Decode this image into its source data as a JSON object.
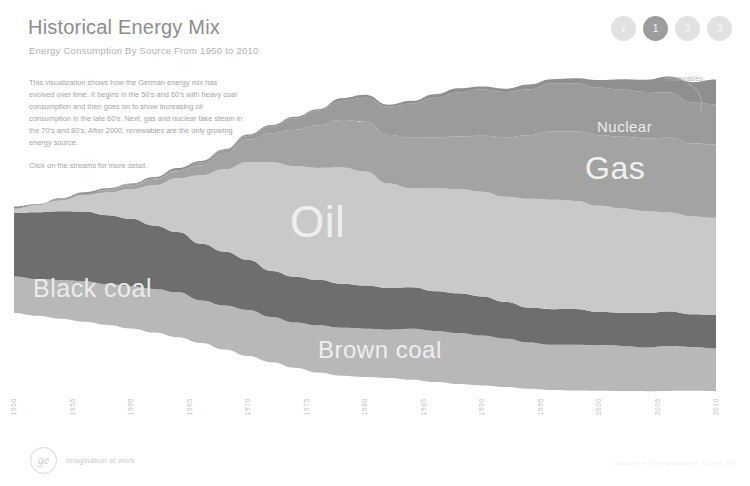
{
  "header": {
    "title": "Historical Energy Mix",
    "subtitle": "Energy Consumption By Source From 1950 to 2010"
  },
  "nav": {
    "back_label": "‹",
    "items": [
      {
        "label": "1",
        "active": true
      },
      {
        "label": "2",
        "active": false
      },
      {
        "label": "3",
        "active": false
      }
    ]
  },
  "intro": {
    "paragraph": "This visualization shows how the German energy mix has evolved over time. It begins in the 50's and 60's with heavy coal consumption and then goes on to show increasing oil consumption in the late 60's. Next, gas and nuclear take steam in the 70's and 80's. After 2000, renewables are the only growing energy source.",
    "hint": "Click on the streams for more detail."
  },
  "labels": {
    "oil": "Oil",
    "gas": "Gas",
    "nuclear": "Nuclear",
    "black_coal": "Black coal",
    "brown_coal": "Brown coal",
    "renewables": "Renewables"
  },
  "footer": {
    "logo_text": "ge",
    "tagline": "Imagination at work",
    "sources": "Sources: AG Energiebilanzen, Kohlen, EPI"
  },
  "colors": {
    "brown_coal": "#b8b8b8",
    "black_coal": "#6e6e6e",
    "oil": "#c9c9c9",
    "gas": "#a3a3a3",
    "nuclear": "#9b9b9b",
    "renewables": "#8f8f8f",
    "active_dot": "#9d9d9d",
    "inactive_dot": "#e2e2e2",
    "title": "#8d8d8d"
  },
  "chart_data": {
    "type": "area",
    "title": "Historical Energy Mix",
    "subtitle": "Energy Consumption By Source From 1950 to 2010",
    "xlabel": "",
    "ylabel": "",
    "stacked": true,
    "grid": false,
    "legend": "inline-labels",
    "xlim": [
      1950,
      2010
    ],
    "x": [
      1950,
      1952,
      1954,
      1956,
      1958,
      1960,
      1962,
      1964,
      1966,
      1968,
      1970,
      1972,
      1974,
      1976,
      1978,
      1980,
      1982,
      1984,
      1986,
      1988,
      1990,
      1992,
      1994,
      1996,
      1998,
      2000,
      2002,
      2004,
      2006,
      2008,
      2010
    ],
    "tick_labels": [
      "1950",
      "1955",
      "1960",
      "1965",
      "1970",
      "1975",
      "1980",
      "1985",
      "1990",
      "1995",
      "2000",
      "2005",
      "2010"
    ],
    "tick_years": [
      1950,
      1955,
      1960,
      1965,
      1970,
      1975,
      1980,
      1985,
      1990,
      1995,
      2000,
      2005,
      2010
    ],
    "series": [
      {
        "name": "Brown coal",
        "color": "#b8b8b8",
        "values": [
          30,
          31,
          32,
          33,
          34,
          35,
          35,
          36,
          35,
          36,
          37,
          37,
          38,
          39,
          39,
          40,
          40,
          41,
          41,
          42,
          41,
          39,
          38,
          38,
          38,
          37,
          37,
          36,
          36,
          35,
          35
        ]
      },
      {
        "name": "Black coal",
        "color": "#6e6e6e",
        "values": [
          52,
          54,
          56,
          58,
          57,
          55,
          52,
          50,
          46,
          43,
          41,
          38,
          37,
          37,
          37,
          36,
          34,
          34,
          33,
          32,
          31,
          30,
          29,
          29,
          29,
          28,
          28,
          28,
          28,
          27,
          27
        ]
      },
      {
        "name": "Oil",
        "color": "#c9c9c9",
        "values": [
          4,
          6,
          9,
          13,
          18,
          25,
          34,
          44,
          56,
          68,
          80,
          88,
          90,
          92,
          95,
          93,
          86,
          82,
          84,
          85,
          86,
          86,
          88,
          89,
          89,
          87,
          85,
          84,
          82,
          80,
          79
        ]
      },
      {
        "name": "Gas",
        "color": "#a3a3a3",
        "values": [
          0,
          0,
          1,
          1,
          2,
          3,
          4,
          6,
          9,
          13,
          18,
          24,
          30,
          34,
          38,
          41,
          40,
          41,
          42,
          44,
          46,
          48,
          52,
          56,
          56,
          57,
          59,
          60,
          61,
          60,
          61
        ]
      },
      {
        "name": "Nuclear",
        "color": "#9b9b9b",
        "values": [
          0,
          0,
          0,
          0,
          0,
          0,
          1,
          1,
          2,
          3,
          4,
          6,
          9,
          12,
          16,
          19,
          22,
          28,
          33,
          36,
          38,
          38,
          38,
          39,
          39,
          39,
          38,
          37,
          37,
          34,
          33
        ]
      },
      {
        "name": "Renewables",
        "color": "#8f8f8f",
        "values": [
          1,
          1,
          1,
          1,
          1,
          1,
          1,
          1,
          1,
          1,
          1,
          1,
          2,
          2,
          2,
          2,
          2,
          2,
          2,
          3,
          3,
          3,
          4,
          4,
          5,
          6,
          8,
          10,
          13,
          16,
          20
        ]
      }
    ]
  }
}
